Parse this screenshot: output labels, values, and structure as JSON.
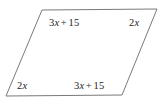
{
  "figure": {
    "name": "parallelogram-angle-diagram",
    "shape": "parallelogram",
    "stroke_color": "#7a7a7a",
    "fill_color": "#ffffff",
    "background_color": "#ffffff",
    "text_color": "#262626",
    "vertices": [
      {
        "name": "top-left",
        "x": 42,
        "y": 10
      },
      {
        "name": "top-right",
        "x": 157,
        "y": 9
      },
      {
        "name": "bottom-right",
        "x": 122,
        "y": 95
      },
      {
        "name": "bottom-left",
        "x": 6,
        "y": 96
      }
    ],
    "points_path": "42,10 157,9 122,95 6,96"
  },
  "labels": {
    "top_left": {
      "full": "3x + 15",
      "coefficient": "3",
      "variable": "x",
      "operator": "+",
      "constant": "15"
    },
    "top_right": {
      "full": "2x",
      "coefficient": "2",
      "variable": "x"
    },
    "bottom_left": {
      "full": "2x",
      "coefficient": "2",
      "variable": "x"
    },
    "bottom_right": {
      "full": "3x + 15",
      "coefficient": "3",
      "variable": "x",
      "operator": "+",
      "constant": "15"
    }
  }
}
